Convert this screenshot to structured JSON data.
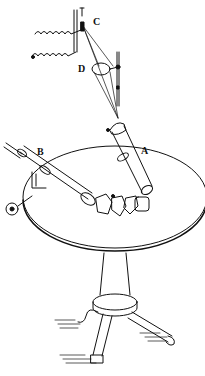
{
  "figure": {
    "labels": {
      "A": "A",
      "B": "B",
      "C": "C",
      "D": "D"
    },
    "ink_color": "#111111",
    "background": "#ffffff"
  }
}
